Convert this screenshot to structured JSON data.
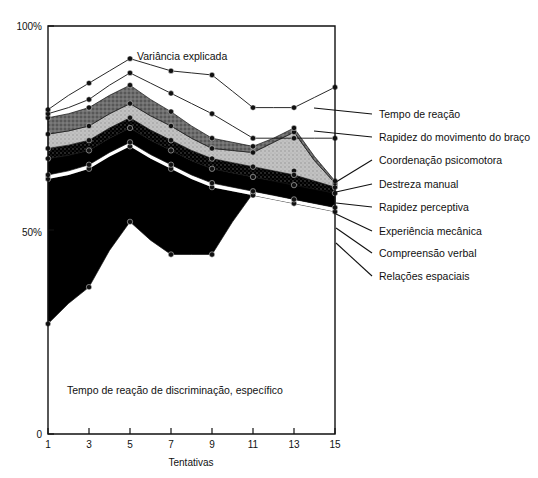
{
  "chart_data": {
    "type": "area",
    "title": "",
    "annotations": [
      {
        "name": "variance-note",
        "text": "Variância explicada",
        "x": 11.0,
        "y": 92.0
      },
      {
        "name": "bottom-region-note",
        "text": "Tempo de reação de discriminação, específico",
        "x": 5.6,
        "y": 13.0
      }
    ],
    "xlabel": "Tentativas",
    "ylabel": "",
    "x": [
      1,
      2,
      3,
      4,
      5,
      6,
      7,
      8,
      9,
      10,
      11,
      12,
      13,
      14,
      15
    ],
    "xticks": [
      1,
      3,
      5,
      7,
      9,
      11,
      13,
      15
    ],
    "xticklabels": [
      "1",
      "3",
      "5",
      "7",
      "9",
      "11",
      "13",
      "15"
    ],
    "xlim": [
      1,
      15
    ],
    "yticks": [
      0,
      50,
      100
    ],
    "yticklabels": [
      "0",
      "50%",
      "100%"
    ],
    "ylim": [
      0,
      100
    ],
    "grid": false,
    "legend_position": "right-leader-lines",
    "stacked": true,
    "note": "Cumulative stacked areas; values are cumulative percent of explained variance at each trial (top of each band).",
    "series": [
      {
        "name": "Tempo de reação de discriminação, específico",
        "fill": "white",
        "cumulative_top": [
          27.0,
          32.0,
          36.0,
          45.0,
          52.0,
          47.5,
          44.0,
          44.0,
          44.0,
          52.0,
          59.0,
          63.0,
          64.5,
          63.0,
          61.0
        ]
      },
      {
        "name": "Relações espaciais",
        "fill": "black",
        "cumulative_top": [
          62.5,
          63.5,
          65.0,
          68.0,
          70.5,
          67.5,
          65.0,
          62.5,
          60.5,
          59.5,
          58.5,
          57.5,
          56.5,
          55.5,
          54.5
        ]
      },
      {
        "name": "Compreensão verbal",
        "fill": "white-gap",
        "cumulative_top": [
          63.5,
          64.5,
          66.0,
          69.0,
          71.5,
          68.5,
          66.0,
          63.5,
          61.5,
          60.5,
          59.5,
          58.5,
          57.5,
          56.5,
          55.5
        ]
      },
      {
        "name": "Experiência mecânica",
        "fill": "black",
        "cumulative_top": [
          67.5,
          68.3,
          69.5,
          72.5,
          75.0,
          72.0,
          69.5,
          67.0,
          65.0,
          64.0,
          63.0,
          62.0,
          61.0,
          60.0,
          59.0
        ]
      },
      {
        "name": "Rapidez perceptiva",
        "fill": "dark-stipple",
        "cumulative_top": [
          70.0,
          70.8,
          72.0,
          75.0,
          77.5,
          74.5,
          72.0,
          69.5,
          67.5,
          66.5,
          65.5,
          64.5,
          63.5,
          62.0,
          60.5
        ]
      },
      {
        "name": "Destreza manual",
        "fill": "light-gray",
        "cumulative_top": [
          73.5,
          74.3,
          75.5,
          78.5,
          81.0,
          78.0,
          75.5,
          72.5,
          70.0,
          69.5,
          69.0,
          71.5,
          74.0,
          67.0,
          61.5
        ]
      },
      {
        "name": "Coordenação psicomotora",
        "fill": "mid-gray",
        "cumulative_top": [
          77.5,
          78.5,
          80.0,
          83.0,
          85.5,
          82.0,
          79.0,
          75.5,
          72.5,
          71.5,
          70.5,
          72.5,
          75.0,
          68.0,
          62.0
        ]
      },
      {
        "name": "Rapidez do movimento do braço",
        "fill": "line",
        "cumulative_top": [
          78.5,
          80.0,
          82.0,
          85.5,
          88.5,
          86.0,
          83.5,
          81.0,
          78.5,
          75.5,
          72.5,
          72.5,
          72.5,
          72.5,
          72.5
        ]
      },
      {
        "name": "Tempo de reação",
        "fill": "line",
        "cumulative_top": [
          79.5,
          83.0,
          86.0,
          89.0,
          92.0,
          90.5,
          89.0,
          88.5,
          88.0,
          84.0,
          80.0,
          80.0,
          80.0,
          82.5,
          85.0
        ]
      }
    ]
  },
  "axis": {
    "y_top_label": "100%",
    "y_mid_label": "50%",
    "y_bottom_label": "0",
    "x_title": "Tentativas"
  },
  "labels": {
    "variance": "Variância explicada",
    "bottom_region": "Tempo de reação de discriminação, específico"
  },
  "legend": {
    "items": [
      {
        "id": "tempo-de-reacao",
        "label": "Tempo de reação"
      },
      {
        "id": "rapidez-movimento-braco",
        "label": "Rapidez do movimento do braço"
      },
      {
        "id": "coordenacao-psicomotora",
        "label": "Coordenação psicomotora"
      },
      {
        "id": "destreza-manual",
        "label": "Destreza manual"
      },
      {
        "id": "rapidez-perceptiva",
        "label": "Rapidez perceptiva"
      },
      {
        "id": "experiencia-mecanica",
        "label": "Experiência mecânica"
      },
      {
        "id": "compreensao-verbal",
        "label": "Compreensão verbal"
      },
      {
        "id": "relacoes-espaciais",
        "label": "Relações espaciais"
      }
    ]
  },
  "colors": {
    "ink": "#111111",
    "black_fill": "#000000",
    "mid_gray": "#6e6e6e",
    "light_gray": "#bdbdbd",
    "dark_stipple": "#2a2a2a",
    "paper": "#ffffff"
  }
}
